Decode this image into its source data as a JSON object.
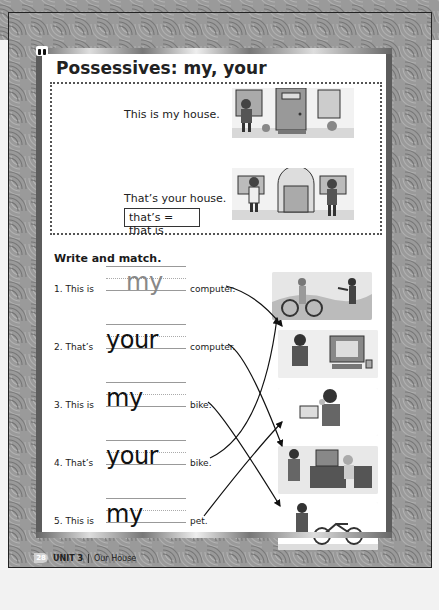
{
  "lesson": {
    "title": "Possessives: my, your",
    "icon": "audio-icon"
  },
  "presentation": {
    "sentence_1": "This is my house.",
    "sentence_2": "That’s your house.",
    "contraction_note": "that’s = that is"
  },
  "exercise": {
    "title": "Write and match.",
    "items": [
      {
        "number": "1.",
        "prefix": "This is",
        "answer": "my",
        "noun": "computer.",
        "example": true
      },
      {
        "number": "2.",
        "prefix": "That’s",
        "answer": "your",
        "noun": "computer.",
        "example": false
      },
      {
        "number": "3.",
        "prefix": "This is",
        "answer": "my",
        "noun": "bike.",
        "example": false
      },
      {
        "number": "4.",
        "prefix": "That’s",
        "answer": "your",
        "noun": "bike.",
        "example": false
      },
      {
        "number": "5.",
        "prefix": "This is",
        "answer": "my",
        "noun": "pet.",
        "example": false
      }
    ],
    "pictures": [
      "boy-pointing-at-bike-outdoors",
      "boy-with-his-computer",
      "boy-with-pet-bird",
      "boy-pointing-at-girl-computer",
      "boy-with-his-bike"
    ],
    "matches": [
      {
        "item": 1,
        "picture": 2
      },
      {
        "item": 2,
        "picture": 4
      },
      {
        "item": 3,
        "picture": 5
      },
      {
        "item": 4,
        "picture": 1
      },
      {
        "item": 5,
        "picture": 3
      }
    ]
  },
  "footer": {
    "page_number": "28",
    "unit": "UNIT 3",
    "unit_title": "Our House"
  }
}
